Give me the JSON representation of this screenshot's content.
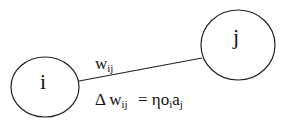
{
  "diagram": {
    "nodes": [
      {
        "id": "i",
        "label": "i"
      },
      {
        "id": "j",
        "label": "j"
      }
    ],
    "edge": {
      "weight_main": "w",
      "weight_sub": "ij"
    },
    "update_rule": {
      "delta": "Δ",
      "w": "w",
      "w_sub": "ij",
      "equals": "=",
      "eta_o": "ηo",
      "o_sub": "i",
      "a": "a",
      "a_sub": "j"
    },
    "colors": {
      "stroke": "#222222",
      "background": "#ffffff"
    }
  }
}
